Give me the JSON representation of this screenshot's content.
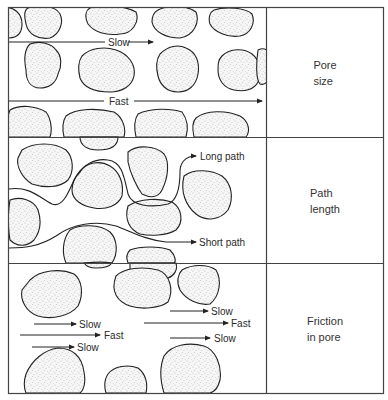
{
  "rows": [
    {
      "id": "pore-size",
      "label": "Pore\nsize",
      "annotations": [
        "Slow",
        "Fast"
      ]
    },
    {
      "id": "path-length",
      "label": "Path\nlength",
      "annotations": [
        "Long path",
        "Short path"
      ]
    },
    {
      "id": "friction-in-pore",
      "label": "Friction\nin pore",
      "annotations": [
        "Slow",
        "Fast",
        "Slow",
        "Slow",
        "Fast",
        "Slow"
      ]
    }
  ],
  "colors": {
    "line": "#222222",
    "border": "#444444",
    "grain_fill": "#f4f4f4",
    "grain_stipple": "#777777",
    "background": "#ffffff"
  }
}
